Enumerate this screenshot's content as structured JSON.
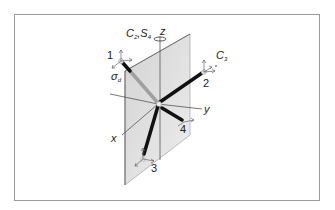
{
  "figure": {
    "labels": {
      "axis_z": "z",
      "axis_y": "y",
      "axis_x": "x",
      "c2_s4_main": "C",
      "c2_sub": "2",
      "comma": ",",
      "s4_main": "S",
      "s4_sub": "4",
      "c3_main": "C",
      "c3_sub": "3",
      "sigma_main": "σ",
      "sigma_sub": "d",
      "atom_1": "1",
      "atom_2": "2",
      "atom_3": "3",
      "atom_4": "4"
    },
    "colors": {
      "frame": "#9a9a9a",
      "plane": "#d9d9d9",
      "bond_front": "#111111",
      "bond_back": "#9c9c9c",
      "axis": "#555555"
    }
  }
}
